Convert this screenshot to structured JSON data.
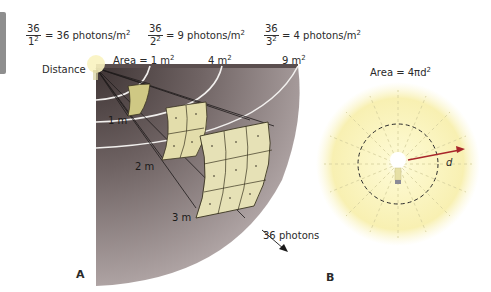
{
  "equations": [
    {
      "numerator": "36",
      "denominator": "1",
      "exponent": "2",
      "result": "= 36 photons/m",
      "unit_exp": "2"
    },
    {
      "numerator": "36",
      "denominator": "2",
      "exponent": "2",
      "result": "= 9 photons/m",
      "unit_exp": "2"
    },
    {
      "numerator": "36",
      "denominator": "3",
      "exponent": "2",
      "result": "= 4 photons/m",
      "unit_exp": "2"
    }
  ],
  "panel_a": {
    "label": "A",
    "distance_label": "Distance",
    "area_labels": [
      {
        "text": "Area = 1 m",
        "exp": "2"
      },
      {
        "text": "4 m",
        "exp": "2"
      },
      {
        "text": "9 m",
        "exp": "2"
      }
    ],
    "distance_marks": [
      "1 m",
      "2 m",
      "3 m"
    ],
    "photons_label": "36 photons"
  },
  "panel_b": {
    "label": "B",
    "formula": "Area = 4πd",
    "formula_exp": "2",
    "radius_label": "d"
  },
  "colors": {
    "cone_dark": "#4a4040",
    "cone_light": "#a89c9c",
    "patch_fill": "#e6e1b0",
    "glow": "#fbf6b8",
    "arrow_red": "#a8262a"
  }
}
